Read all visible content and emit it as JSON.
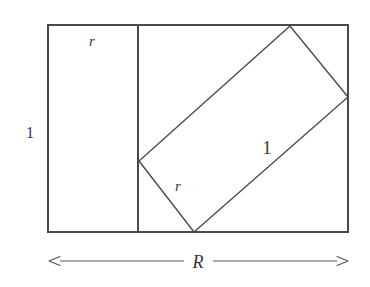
{
  "figure": {
    "background_color": "#ffffff",
    "stroke_color": "#4a4a4e",
    "text_color": "#36363a",
    "canvas": {
      "width": 370,
      "height": 287
    }
  },
  "outer_rectangle": {
    "name": "outer-rectangle",
    "left": 48,
    "top": 25,
    "right": 348,
    "bottom": 232,
    "width": 300,
    "height": 207,
    "stroke_width": 1.6
  },
  "divider": {
    "name": "vertical-divider",
    "x": 138,
    "top": 25,
    "bottom": 232,
    "stroke_width": 1.6
  },
  "tilted_rectangle": {
    "name": "tilted-rectangle",
    "stroke_width": 1.4,
    "vertices": [
      {
        "label": "left-vertex",
        "x": 139,
        "y": 161
      },
      {
        "label": "bottom-vertex",
        "x": 194,
        "y": 232
      },
      {
        "label": "top-vertex",
        "x": 290,
        "y": 26
      },
      {
        "label": "right-vertex",
        "x": 348,
        "y": 97
      }
    ],
    "points_attr": "139,161 194,232 348,97 290,26"
  },
  "labels": {
    "left_strip_width": {
      "text": "r",
      "x": 92,
      "y": 41,
      "style": "italic",
      "size": "sm"
    },
    "left_height": {
      "text": "1",
      "x": 30,
      "y": 133,
      "style": "upright",
      "size": "md"
    },
    "tilted_long_side": {
      "text": "1",
      "x": 267,
      "y": 148,
      "style": "upright",
      "size": "lg"
    },
    "tilted_short_side": {
      "text": "r",
      "x": 178,
      "y": 186,
      "style": "italic",
      "size": "sm"
    },
    "total_width": {
      "text": "R",
      "x": 198,
      "y": 262,
      "style": "italic",
      "size": "lg"
    }
  },
  "dimension_arrow": {
    "name": "width-dimension-arrow",
    "y": 261,
    "left_tip_x": 49,
    "right_tip_x": 348,
    "left_segment_end_x": 184,
    "right_segment_start_x": 213,
    "stroke_width": 1.1,
    "arrowhead_length": 11,
    "arrowhead_half_width": 4.5
  }
}
